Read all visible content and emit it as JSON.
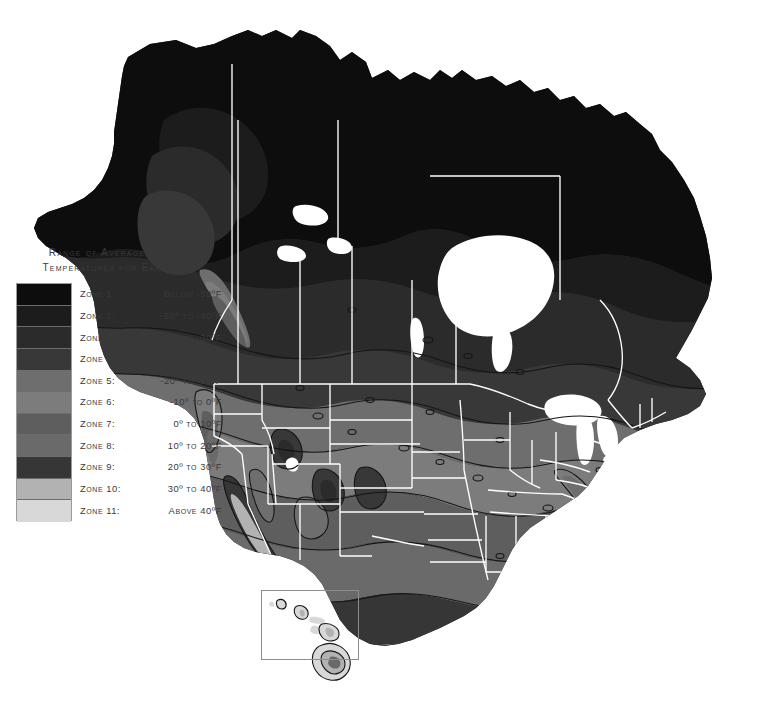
{
  "figure": {
    "name": "plant-hardiness-zone-map",
    "background_color": "#ffffff",
    "water_color": "#ffffff",
    "state_border_color": "#ffffff",
    "zone_contour_color": "#1a1a1a"
  },
  "legend": {
    "title": "Range of Average Minimum\nTemperatures for Each Zone",
    "rows": [
      {
        "zone": "Zone 1:",
        "range": "Below -50ºF",
        "color": "#0d0d0d"
      },
      {
        "zone": "Zone 2:",
        "range": "-50º to -40ºF",
        "color": "#1c1c1c"
      },
      {
        "zone": "Zone 3:",
        "range": "-40º to -30ºF",
        "color": "#2b2b2b"
      },
      {
        "zone": "Zone 4:",
        "range": "-30º to -20ºF",
        "color": "#383838"
      },
      {
        "zone": "Zone 5:",
        "range": "-20º to -10ºF",
        "color": "#6e6e6e"
      },
      {
        "zone": "Zone 6:",
        "range": "-10º to 0ºF",
        "color": "#7c7c7c"
      },
      {
        "zone": "Zone 7:",
        "range": "0º to 10ºF",
        "color": "#5e5e5e"
      },
      {
        "zone": "Zone 8:",
        "range": "10º to 20ºF",
        "color": "#6a6a6a"
      },
      {
        "zone": "Zone 9:",
        "range": "20º to 30ºF",
        "color": "#363636"
      },
      {
        "zone": "Zone 10:",
        "range": "30º to 40ºF",
        "color": "#b2b2b2"
      },
      {
        "zone": "Zone 11:",
        "range": "Above 40ºF",
        "color": "#d8d8d8"
      }
    ]
  },
  "chart_data": {
    "type": "map",
    "title": "Range of Average Minimum Temperatures for Each Zone",
    "region": "North America",
    "projection_note": "Continental North America with Hawaii inset",
    "categories": [
      "Zone 1",
      "Zone 2",
      "Zone 3",
      "Zone 4",
      "Zone 5",
      "Zone 6",
      "Zone 7",
      "Zone 8",
      "Zone 9",
      "Zone 10",
      "Zone 11"
    ],
    "zone_bounds_f": [
      {
        "zone": 1,
        "min": null,
        "max": -50
      },
      {
        "zone": 2,
        "min": -50,
        "max": -40
      },
      {
        "zone": 3,
        "min": -40,
        "max": -30
      },
      {
        "zone": 4,
        "min": -30,
        "max": -20
      },
      {
        "zone": 5,
        "min": -20,
        "max": -10
      },
      {
        "zone": 6,
        "min": -10,
        "max": 0
      },
      {
        "zone": 7,
        "min": 0,
        "max": 10
      },
      {
        "zone": 8,
        "min": 10,
        "max": 20
      },
      {
        "zone": 9,
        "min": 20,
        "max": 30
      },
      {
        "zone": 10,
        "min": 30,
        "max": 40
      },
      {
        "zone": 11,
        "min": 40,
        "max": null
      }
    ],
    "colors": [
      "#0d0d0d",
      "#1c1c1c",
      "#2b2b2b",
      "#383838",
      "#6e6e6e",
      "#7c7c7c",
      "#5e5e5e",
      "#6a6a6a",
      "#363636",
      "#b2b2b2",
      "#d8d8d8"
    ],
    "insets": [
      "Hawaii"
    ],
    "legend_position": "left"
  }
}
